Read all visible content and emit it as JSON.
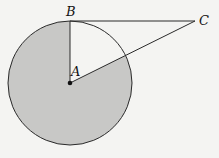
{
  "diagram": {
    "type": "geometry",
    "points": {
      "A": {
        "label": "A",
        "x": 70,
        "y": 83
      },
      "B": {
        "label": "B",
        "x": 70,
        "y": 21
      },
      "C": {
        "label": "C",
        "x": 195,
        "y": 21
      }
    },
    "circle": {
      "center": "A",
      "radius": 62
    },
    "segments": [
      [
        "A",
        "B"
      ],
      [
        "B",
        "C"
      ],
      [
        "A",
        "C"
      ]
    ],
    "shaded": "circle minus sector BAC",
    "colors": {
      "shade": "#c8c8c6",
      "stroke": "#2a2a2a",
      "background": "#f4f4f2"
    }
  }
}
